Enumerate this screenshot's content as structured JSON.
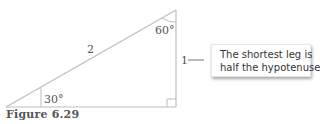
{
  "figure": {
    "caption": "Figure 6.29",
    "colors": {
      "line": "#bdbdbd",
      "label": "#555555",
      "callout_text": "#333333",
      "callout_bg": "#ffffff"
    }
  },
  "triangle": {
    "type": "30-60-90 right triangle",
    "hypotenuse_label": "2",
    "short_leg_label": "1",
    "top_angle_label": "60°",
    "left_angle_label": "30°",
    "right_angle_marker": true
  },
  "callout": {
    "line1": "The shortest leg is",
    "line2": "half the hypotenuse."
  }
}
